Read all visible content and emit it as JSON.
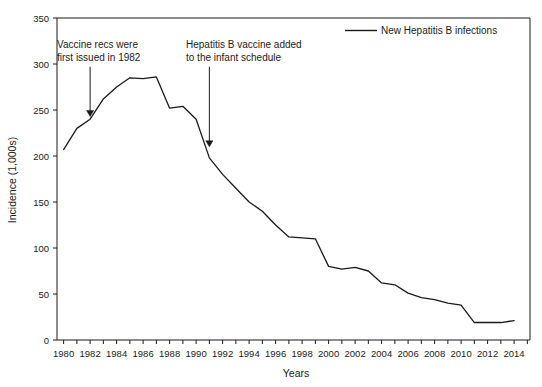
{
  "chart_data": {
    "type": "line",
    "title": "",
    "xlabel": "Years",
    "ylabel": "Incidence (1,000s)",
    "xlim": [
      1979.5,
      2015.2
    ],
    "ylim": [
      0,
      350
    ],
    "grid": false,
    "legend_position": "top-right",
    "x": [
      1980,
      1981,
      1982,
      1983,
      1984,
      1985,
      1986,
      1987,
      1988,
      1989,
      1990,
      1991,
      1992,
      1993,
      1994,
      1995,
      1996,
      1997,
      1998,
      1999,
      2000,
      2001,
      2002,
      2003,
      2004,
      2005,
      2006,
      2007,
      2008,
      2009,
      2010,
      2011,
      2012,
      2013,
      2014
    ],
    "series": [
      {
        "name": "New Hepatitis B infections",
        "color": "#1a1a1a",
        "values": [
          207,
          230,
          240,
          262,
          275,
          285,
          284,
          286,
          252,
          254,
          240,
          198,
          180,
          165,
          150,
          140,
          125,
          112,
          111,
          110,
          80,
          77,
          79,
          75,
          62,
          60,
          51,
          46,
          44,
          40,
          38,
          19,
          19,
          19,
          21
        ]
      }
    ],
    "yticks": [
      0,
      50,
      100,
      150,
      200,
      250,
      300,
      350
    ],
    "ytick_labels": [
      "0",
      "50",
      "100",
      "150",
      "200",
      "250",
      "300",
      "350"
    ],
    "xticks": [
      1980,
      1982,
      1984,
      1986,
      1988,
      1990,
      1992,
      1994,
      1996,
      1998,
      2000,
      2002,
      2004,
      2006,
      2008,
      2010,
      2012,
      2014
    ],
    "xtick_labels": [
      "1980",
      "1982",
      "1984",
      "1986",
      "1988",
      "1990",
      "1992",
      "1994",
      "1996",
      "1998",
      "2000",
      "2002",
      "2004",
      "2006",
      "2008",
      "2010",
      "2012",
      "2014"
    ],
    "xtick_minor_step": 1,
    "annotations": [
      {
        "id": "vaccine-recs",
        "lines": [
          "Vaccine recs were",
          "first issued in 1982"
        ],
        "line1": "Vaccine recs were",
        "line2": "first issued in 1982",
        "arrow_x_year": 1982,
        "arrow_from_value": 297,
        "arrow_to_value": 243
      },
      {
        "id": "infant-schedule",
        "lines": [
          "Hepatitis B vaccine added",
          "to the infant schedule"
        ],
        "line1": "Hepatitis B vaccine added",
        "line2": "to the infant schedule",
        "arrow_x_year": 1991,
        "arrow_from_value": 297,
        "arrow_to_value": 210
      }
    ],
    "legend": [
      {
        "label": "New Hepatitis B infections",
        "color": "#1a1a1a"
      }
    ]
  }
}
